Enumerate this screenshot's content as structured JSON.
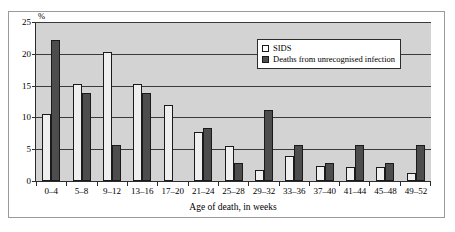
{
  "chart_data": {
    "type": "bar",
    "title": "",
    "xlabel": "Age of death, in weeks",
    "ylabel": "%",
    "ylim": [
      0,
      25
    ],
    "yticks": [
      0,
      5,
      10,
      15,
      20,
      25
    ],
    "grid": true,
    "legend_position": "top-right",
    "categories": [
      "0–4",
      "5–8",
      "9–12",
      "13–16",
      "17–20",
      "21–24",
      "25–28",
      "29–32",
      "33–36",
      "37–40",
      "41–44",
      "45–48",
      "49–52"
    ],
    "series": [
      {
        "name": "SIDS",
        "color": "#efefef",
        "values": [
          10.5,
          15.2,
          20.3,
          15.2,
          12.0,
          7.7,
          5.5,
          1.8,
          4.0,
          2.4,
          2.2,
          2.2,
          1.2
        ]
      },
      {
        "name": "Deaths from unrecognised infection",
        "color": "#4d4d4d",
        "values": [
          22.2,
          13.9,
          5.6,
          13.9,
          0,
          8.3,
          2.8,
          11.1,
          5.6,
          2.8,
          5.6,
          2.8,
          5.6
        ]
      }
    ]
  },
  "axis": {
    "y_unit_label": "%",
    "y_tick_labels": [
      "25",
      "20",
      "15",
      "10",
      "5",
      "0"
    ],
    "x_title": "Age of death, in weeks"
  },
  "legend": {
    "items": [
      {
        "label": "SIDS"
      },
      {
        "label": "Deaths from unrecognised infection"
      }
    ]
  }
}
